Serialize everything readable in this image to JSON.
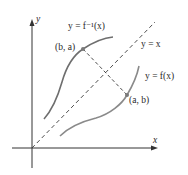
{
  "diagram": {
    "axes": {
      "x_label": "x",
      "y_label": "y"
    },
    "labels": {
      "inverse_curve": "y = f⁻¹(x)",
      "identity_line": "y = x",
      "function_curve": "y = f(x)",
      "point_ba": "(b, a)",
      "point_ab": "(a, b)"
    },
    "colors": {
      "axis": "#333333",
      "curve": "#6e6e6e",
      "dashed": "#3a3a3a",
      "point": "#7a7a7a",
      "text": "#2a2a2a"
    }
  }
}
